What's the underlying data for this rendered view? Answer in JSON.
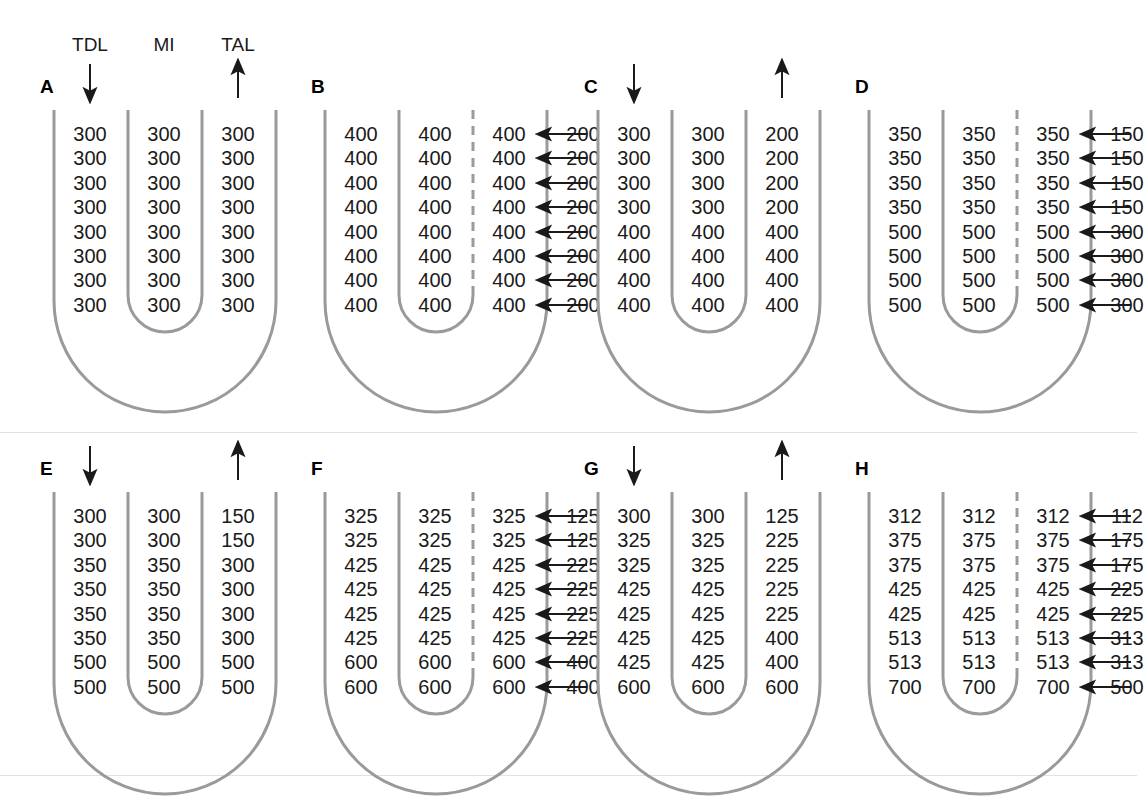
{
  "figure": {
    "type": "diagram",
    "column_headers": [
      {
        "key": "tdl",
        "label": "TDL",
        "flow": "down"
      },
      {
        "key": "mi",
        "label": "MI",
        "flow": "none"
      },
      {
        "key": "tal",
        "label": "TAL",
        "flow": "up"
      }
    ],
    "colors": {
      "tube_stroke": "#9a9a9a",
      "dashed_wall": "#9a9a9a",
      "text": "#1a1a1a",
      "arrow": "#1a1a1a",
      "background": "#ffffff"
    }
  },
  "panels": [
    {
      "id": "A",
      "label": "A",
      "show_headers": true,
      "show_flow_arrows": true,
      "dashed_wall": false,
      "transport_arrows": false,
      "rows": [
        {
          "tdl": "300",
          "mi": "300",
          "tal": "300",
          "out": ""
        },
        {
          "tdl": "300",
          "mi": "300",
          "tal": "300",
          "out": ""
        },
        {
          "tdl": "300",
          "mi": "300",
          "tal": "300",
          "out": ""
        },
        {
          "tdl": "300",
          "mi": "300",
          "tal": "300",
          "out": ""
        },
        {
          "tdl": "300",
          "mi": "300",
          "tal": "300",
          "out": ""
        },
        {
          "tdl": "300",
          "mi": "300",
          "tal": "300",
          "out": ""
        },
        {
          "tdl": "300",
          "mi": "300",
          "tal": "300",
          "out": ""
        },
        {
          "tdl": "300",
          "mi": "300",
          "tal": "300",
          "out": ""
        }
      ]
    },
    {
      "id": "B",
      "label": "B",
      "show_headers": false,
      "show_flow_arrows": false,
      "dashed_wall": true,
      "transport_arrows": true,
      "rows": [
        {
          "tdl": "400",
          "mi": "400",
          "tal": "400",
          "out": "200"
        },
        {
          "tdl": "400",
          "mi": "400",
          "tal": "400",
          "out": "200"
        },
        {
          "tdl": "400",
          "mi": "400",
          "tal": "400",
          "out": "200"
        },
        {
          "tdl": "400",
          "mi": "400",
          "tal": "400",
          "out": "200"
        },
        {
          "tdl": "400",
          "mi": "400",
          "tal": "400",
          "out": "200"
        },
        {
          "tdl": "400",
          "mi": "400",
          "tal": "400",
          "out": "200"
        },
        {
          "tdl": "400",
          "mi": "400",
          "tal": "400",
          "out": "200"
        },
        {
          "tdl": "400",
          "mi": "400",
          "tal": "400",
          "out": "200"
        }
      ]
    },
    {
      "id": "C",
      "label": "C",
      "show_headers": false,
      "show_flow_arrows": true,
      "dashed_wall": false,
      "transport_arrows": false,
      "rows": [
        {
          "tdl": "300",
          "mi": "300",
          "tal": "200",
          "out": ""
        },
        {
          "tdl": "300",
          "mi": "300",
          "tal": "200",
          "out": ""
        },
        {
          "tdl": "300",
          "mi": "300",
          "tal": "200",
          "out": ""
        },
        {
          "tdl": "300",
          "mi": "300",
          "tal": "200",
          "out": ""
        },
        {
          "tdl": "400",
          "mi": "400",
          "tal": "400",
          "out": ""
        },
        {
          "tdl": "400",
          "mi": "400",
          "tal": "400",
          "out": ""
        },
        {
          "tdl": "400",
          "mi": "400",
          "tal": "400",
          "out": ""
        },
        {
          "tdl": "400",
          "mi": "400",
          "tal": "400",
          "out": ""
        }
      ]
    },
    {
      "id": "D",
      "label": "D",
      "show_headers": false,
      "show_flow_arrows": false,
      "dashed_wall": true,
      "transport_arrows": true,
      "rows": [
        {
          "tdl": "350",
          "mi": "350",
          "tal": "350",
          "out": "150"
        },
        {
          "tdl": "350",
          "mi": "350",
          "tal": "350",
          "out": "150"
        },
        {
          "tdl": "350",
          "mi": "350",
          "tal": "350",
          "out": "150"
        },
        {
          "tdl": "350",
          "mi": "350",
          "tal": "350",
          "out": "150"
        },
        {
          "tdl": "500",
          "mi": "500",
          "tal": "500",
          "out": "300"
        },
        {
          "tdl": "500",
          "mi": "500",
          "tal": "500",
          "out": "300"
        },
        {
          "tdl": "500",
          "mi": "500",
          "tal": "500",
          "out": "300"
        },
        {
          "tdl": "500",
          "mi": "500",
          "tal": "500",
          "out": "300"
        }
      ]
    },
    {
      "id": "E",
      "label": "E",
      "show_headers": false,
      "show_flow_arrows": true,
      "dashed_wall": false,
      "transport_arrows": false,
      "rows": [
        {
          "tdl": "300",
          "mi": "300",
          "tal": "150",
          "out": ""
        },
        {
          "tdl": "300",
          "mi": "300",
          "tal": "150",
          "out": ""
        },
        {
          "tdl": "350",
          "mi": "350",
          "tal": "300",
          "out": ""
        },
        {
          "tdl": "350",
          "mi": "350",
          "tal": "300",
          "out": ""
        },
        {
          "tdl": "350",
          "mi": "350",
          "tal": "300",
          "out": ""
        },
        {
          "tdl": "350",
          "mi": "350",
          "tal": "300",
          "out": ""
        },
        {
          "tdl": "500",
          "mi": "500",
          "tal": "500",
          "out": ""
        },
        {
          "tdl": "500",
          "mi": "500",
          "tal": "500",
          "out": ""
        }
      ]
    },
    {
      "id": "F",
      "label": "F",
      "show_headers": false,
      "show_flow_arrows": false,
      "dashed_wall": true,
      "transport_arrows": true,
      "rows": [
        {
          "tdl": "325",
          "mi": "325",
          "tal": "325",
          "out": "125"
        },
        {
          "tdl": "325",
          "mi": "325",
          "tal": "325",
          "out": "125"
        },
        {
          "tdl": "425",
          "mi": "425",
          "tal": "425",
          "out": "225"
        },
        {
          "tdl": "425",
          "mi": "425",
          "tal": "425",
          "out": "225"
        },
        {
          "tdl": "425",
          "mi": "425",
          "tal": "425",
          "out": "225"
        },
        {
          "tdl": "425",
          "mi": "425",
          "tal": "425",
          "out": "225"
        },
        {
          "tdl": "600",
          "mi": "600",
          "tal": "600",
          "out": "400"
        },
        {
          "tdl": "600",
          "mi": "600",
          "tal": "600",
          "out": "400"
        }
      ]
    },
    {
      "id": "G",
      "label": "G",
      "show_headers": false,
      "show_flow_arrows": true,
      "dashed_wall": false,
      "transport_arrows": false,
      "rows": [
        {
          "tdl": "300",
          "mi": "300",
          "tal": "125",
          "out": ""
        },
        {
          "tdl": "325",
          "mi": "325",
          "tal": "225",
          "out": ""
        },
        {
          "tdl": "325",
          "mi": "325",
          "tal": "225",
          "out": ""
        },
        {
          "tdl": "425",
          "mi": "425",
          "tal": "225",
          "out": ""
        },
        {
          "tdl": "425",
          "mi": "425",
          "tal": "225",
          "out": ""
        },
        {
          "tdl": "425",
          "mi": "425",
          "tal": "400",
          "out": ""
        },
        {
          "tdl": "425",
          "mi": "425",
          "tal": "400",
          "out": ""
        },
        {
          "tdl": "600",
          "mi": "600",
          "tal": "600",
          "out": ""
        }
      ]
    },
    {
      "id": "H",
      "label": "H",
      "show_headers": false,
      "show_flow_arrows": false,
      "dashed_wall": true,
      "transport_arrows": true,
      "rows": [
        {
          "tdl": "312",
          "mi": "312",
          "tal": "312",
          "out": "112"
        },
        {
          "tdl": "375",
          "mi": "375",
          "tal": "375",
          "out": "175"
        },
        {
          "tdl": "375",
          "mi": "375",
          "tal": "375",
          "out": "175"
        },
        {
          "tdl": "425",
          "mi": "425",
          "tal": "425",
          "out": "225"
        },
        {
          "tdl": "425",
          "mi": "425",
          "tal": "425",
          "out": "225"
        },
        {
          "tdl": "513",
          "mi": "513",
          "tal": "513",
          "out": "313"
        },
        {
          "tdl": "513",
          "mi": "513",
          "tal": "513",
          "out": "313"
        },
        {
          "tdl": "700",
          "mi": "700",
          "tal": "700",
          "out": "500"
        }
      ]
    }
  ]
}
